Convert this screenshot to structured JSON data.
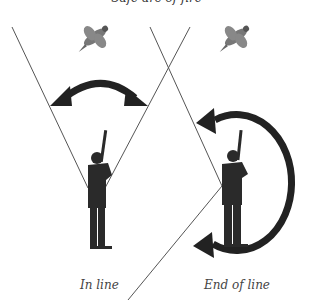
{
  "diagram": {
    "title": "Safe arc of fire",
    "panels": [
      {
        "label": "In line",
        "arrow": "double-headed arc",
        "figure": "shooter"
      },
      {
        "label": "End of line",
        "arrow": "near-circular arc",
        "figure": "shooter"
      }
    ],
    "icons": [
      "pheasant-icon",
      "pheasant-icon"
    ],
    "colors": {
      "arrow": "#222222",
      "line": "#555555",
      "figure": "#222222",
      "text": "#444444"
    }
  }
}
